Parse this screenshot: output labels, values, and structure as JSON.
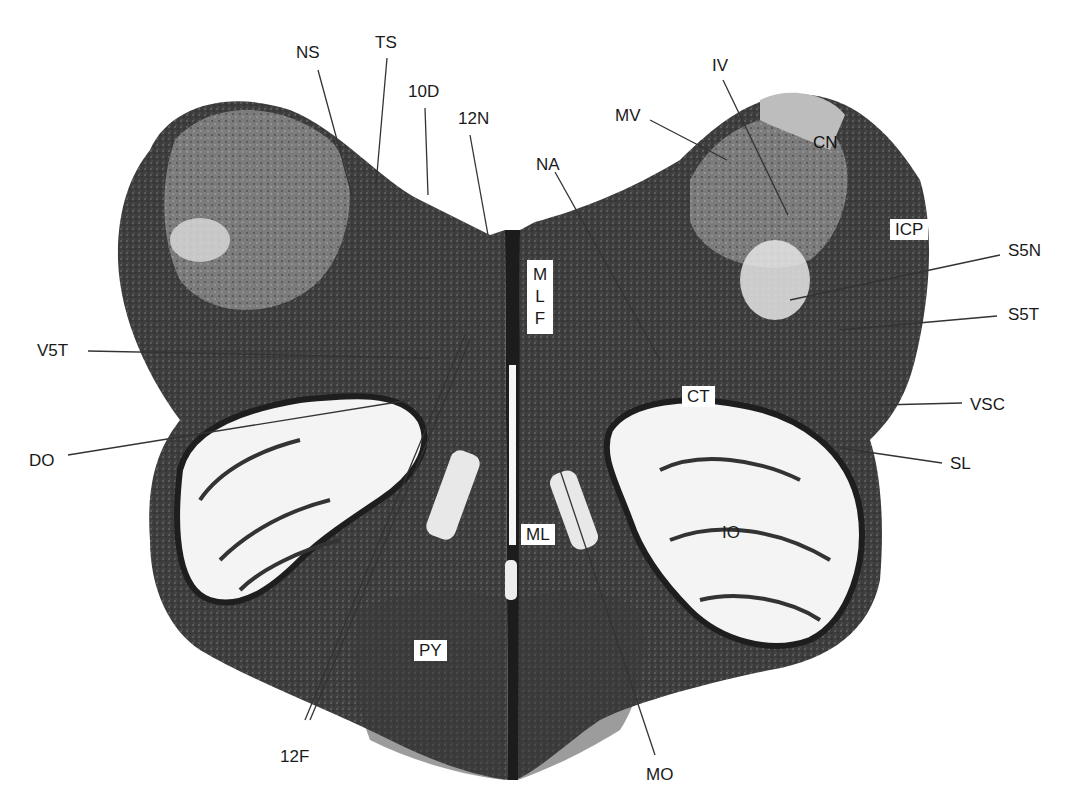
{
  "figure": {
    "colors": {
      "background": "#ffffff",
      "tissue_dark": "#2a2a2a",
      "tissue_mid": "#5a5a5a",
      "white_matter": "#f2f2f2",
      "leader_line": "#333333"
    }
  },
  "labels": {
    "ns": "NS",
    "ts": "TS",
    "d10": "10D",
    "n12": "12N",
    "na": "NA",
    "mv": "MV",
    "iv": "IV",
    "cn": "CN",
    "icp": "ICP",
    "s5n": "S5N",
    "s5t": "S5T",
    "vsc": "VSC",
    "sl": "SL",
    "v5t": "V5T",
    "do": "DO",
    "ct": "CT",
    "io": "IO",
    "ml": "ML",
    "mlf_m": "M",
    "mlf_l": "L",
    "mlf_f": "F",
    "py": "PY",
    "f12": "12F",
    "mo": "MO"
  }
}
